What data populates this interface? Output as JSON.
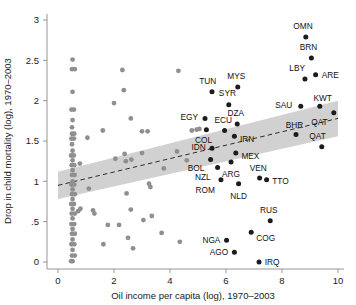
{
  "figure": {
    "name": "oil-income-child-mortality-scatter",
    "xlabel": "Oil income per capita (log), 1970–2003",
    "ylabel": "Drop in child mortality (log), 1970–2003"
  },
  "chart_data": {
    "type": "scatter",
    "title": "",
    "xlabel": "Oil income per capita (log), 1970–2003",
    "ylabel": "Drop in child mortality (log), 1970–2003",
    "xlim": [
      0,
      10
    ],
    "ylim": [
      0,
      3
    ],
    "xticks": [
      0,
      2,
      4,
      6,
      8,
      10
    ],
    "xtick_labels": [
      "0",
      "2",
      "4",
      "6",
      "8",
      "10"
    ],
    "yticks": [
      0,
      0.5,
      1,
      1.5,
      2,
      2.5,
      3
    ],
    "ytick_labels": [
      "0",
      ".5",
      "1",
      "1.5",
      "2",
      "2.5",
      "3"
    ],
    "grid": false,
    "legend_position": "none",
    "series": [
      {
        "name": "labeled-oil-countries",
        "marker": "filled-circle",
        "color": "#1c1c1c",
        "points": [
          {
            "label": "OMN",
            "x": 8.85,
            "y": 2.79,
            "label_dx": -0.1,
            "label_dy": 0.13,
            "label_anchor": "middle"
          },
          {
            "label": "BRN",
            "x": 9.05,
            "y": 2.53,
            "label_dx": -0.1,
            "label_dy": 0.13,
            "label_anchor": "middle"
          },
          {
            "label": "LBY",
            "x": 8.82,
            "y": 2.27,
            "label_dx": -0.28,
            "label_dy": 0.13,
            "label_anchor": "middle"
          },
          {
            "label": "ARE",
            "x": 9.2,
            "y": 2.32,
            "label_dx": 0.22,
            "label_dy": 0.0,
            "label_anchor": "start"
          },
          {
            "label": "MYS",
            "x": 6.42,
            "y": 2.17,
            "label_dx": -0.05,
            "label_dy": 0.14,
            "label_anchor": "middle"
          },
          {
            "label": "TUN",
            "x": 5.5,
            "y": 2.11,
            "label_dx": -0.15,
            "label_dy": 0.13,
            "label_anchor": "middle"
          },
          {
            "label": "SYR",
            "x": 6.1,
            "y": 1.95,
            "label_dx": -0.05,
            "label_dy": 0.14,
            "label_anchor": "middle"
          },
          {
            "label": "SAU",
            "x": 8.67,
            "y": 1.93,
            "label_dx": -0.3,
            "label_dy": 0.02,
            "label_anchor": "end"
          },
          {
            "label": "KWT",
            "x": 9.35,
            "y": 1.93,
            "label_dx": 0.1,
            "label_dy": 0.1,
            "label_anchor": "middle"
          },
          {
            "label": "EGY",
            "x": 5.25,
            "y": 1.78,
            "label_dx": -0.25,
            "label_dy": 0.02,
            "label_anchor": "end"
          },
          {
            "label": "DZA",
            "x": 6.4,
            "y": 1.71,
            "label_dx": -0.05,
            "label_dy": 0.14,
            "label_anchor": "middle"
          },
          {
            "label": "ECU",
            "x": 5.95,
            "y": 1.63,
            "label_dx": -0.05,
            "label_dy": 0.13,
            "label_anchor": "middle"
          },
          {
            "label": "QAT",
            "x": 9.85,
            "y": 1.85,
            "label_dx": -0.22,
            "label_dy": -0.12,
            "label_anchor": "end"
          },
          {
            "label": "COL",
            "x": 5.3,
            "y": 1.64,
            "label_dx": -0.1,
            "label_dy": -0.13,
            "label_anchor": "middle"
          },
          {
            "label": "IRN",
            "x": 6.3,
            "y": 1.56,
            "label_dx": 0.2,
            "label_dy": -0.03,
            "label_anchor": "start"
          },
          {
            "label": "BHR",
            "x": 8.5,
            "y": 1.58,
            "label_dx": -0.05,
            "label_dy": 0.12,
            "label_anchor": "middle"
          },
          {
            "label": "QAT",
            "x": 9.42,
            "y": 1.43,
            "label_dx": -0.15,
            "label_dy": 0.13,
            "label_anchor": "middle"
          },
          {
            "label": "IDN",
            "x": 5.5,
            "y": 1.41,
            "label_dx": -0.22,
            "label_dy": 0.02,
            "label_anchor": "end"
          },
          {
            "label": "MEX",
            "x": 6.35,
            "y": 1.35,
            "label_dx": 0.2,
            "label_dy": -0.03,
            "label_anchor": "start"
          },
          {
            "label": "BOL",
            "x": 5.45,
            "y": 1.27,
            "label_dx": -0.22,
            "label_dy": -0.1,
            "label_anchor": "end"
          },
          {
            "label": "ARG",
            "x": 6.18,
            "y": 1.24,
            "label_dx": 0.0,
            "label_dy": -0.15,
            "label_anchor": "middle"
          },
          {
            "label": "NZL",
            "x": 5.7,
            "y": 1.17,
            "label_dx": -0.25,
            "label_dy": -0.12,
            "label_anchor": "end"
          },
          {
            "label": "VEN",
            "x": 7.2,
            "y": 1.04,
            "label_dx": -0.05,
            "label_dy": 0.13,
            "label_anchor": "middle"
          },
          {
            "label": "TTO",
            "x": 7.45,
            "y": 1.02,
            "label_dx": 0.2,
            "label_dy": -0.02,
            "label_anchor": "start"
          },
          {
            "label": "ROM",
            "x": 5.82,
            "y": 1.02,
            "label_dx": -0.22,
            "label_dy": -0.13,
            "label_anchor": "end"
          },
          {
            "label": "NLD",
            "x": 6.45,
            "y": 0.97,
            "label_dx": 0.0,
            "label_dy": -0.15,
            "label_anchor": "middle"
          },
          {
            "label": "RUS",
            "x": 7.58,
            "y": 0.51,
            "label_dx": -0.05,
            "label_dy": 0.13,
            "label_anchor": "middle"
          },
          {
            "label": "COG",
            "x": 6.9,
            "y": 0.37,
            "label_dx": 0.18,
            "label_dy": -0.07,
            "label_anchor": "start"
          },
          {
            "label": "NGA",
            "x": 6.02,
            "y": 0.27,
            "label_dx": -0.22,
            "label_dy": 0.0,
            "label_anchor": "end"
          },
          {
            "label": "AGO",
            "x": 6.3,
            "y": 0.12,
            "label_dx": -0.22,
            "label_dy": 0.0,
            "label_anchor": "end"
          },
          {
            "label": "IRQ",
            "x": 7.18,
            "y": 0.0,
            "label_dx": 0.2,
            "label_dy": 0.0,
            "label_anchor": "start"
          }
        ]
      },
      {
        "name": "unlabeled-countries",
        "marker": "filled-circle",
        "color": "#8f8f8f",
        "points": [
          {
            "x": 0.52,
            "y": 2.51
          },
          {
            "x": 0.5,
            "y": 2.39
          },
          {
            "x": 0.6,
            "y": 2.39
          },
          {
            "x": 0.52,
            "y": 2.11
          },
          {
            "x": 0.48,
            "y": 1.89
          },
          {
            "x": 0.57,
            "y": 1.89
          },
          {
            "x": 0.52,
            "y": 1.76
          },
          {
            "x": 0.5,
            "y": 1.67
          },
          {
            "x": 0.5,
            "y": 1.59
          },
          {
            "x": 0.58,
            "y": 1.59
          },
          {
            "x": 0.48,
            "y": 1.53
          },
          {
            "x": 0.57,
            "y": 1.53
          },
          {
            "x": 0.5,
            "y": 1.46
          },
          {
            "x": 0.52,
            "y": 1.38
          },
          {
            "x": 0.47,
            "y": 1.32
          },
          {
            "x": 0.56,
            "y": 1.32
          },
          {
            "x": 0.52,
            "y": 1.26
          },
          {
            "x": 0.49,
            "y": 1.2
          },
          {
            "x": 0.58,
            "y": 1.2
          },
          {
            "x": 0.52,
            "y": 1.14
          },
          {
            "x": 0.5,
            "y": 1.08
          },
          {
            "x": 0.59,
            "y": 1.08
          },
          {
            "x": 0.52,
            "y": 1.0
          },
          {
            "x": 0.48,
            "y": 0.96
          },
          {
            "x": 0.58,
            "y": 0.96
          },
          {
            "x": 0.52,
            "y": 0.9
          },
          {
            "x": 0.5,
            "y": 0.84
          },
          {
            "x": 0.6,
            "y": 0.84
          },
          {
            "x": 0.52,
            "y": 0.78
          },
          {
            "x": 0.47,
            "y": 0.72
          },
          {
            "x": 0.57,
            "y": 0.72
          },
          {
            "x": 0.52,
            "y": 0.66
          },
          {
            "x": 0.49,
            "y": 0.6
          },
          {
            "x": 0.6,
            "y": 0.6
          },
          {
            "x": 0.52,
            "y": 0.54
          },
          {
            "x": 0.48,
            "y": 0.47
          },
          {
            "x": 0.58,
            "y": 0.47
          },
          {
            "x": 0.52,
            "y": 0.41
          },
          {
            "x": 0.5,
            "y": 0.35
          },
          {
            "x": 0.6,
            "y": 0.35
          },
          {
            "x": 0.52,
            "y": 0.28
          },
          {
            "x": 0.48,
            "y": 0.22
          },
          {
            "x": 0.58,
            "y": 0.22
          },
          {
            "x": 0.52,
            "y": 0.15
          },
          {
            "x": 0.5,
            "y": 0.08
          },
          {
            "x": 0.6,
            "y": 0.08
          },
          {
            "x": 0.52,
            "y": 0.01
          },
          {
            "x": 0.47,
            "y": 0.01
          },
          {
            "x": 0.78,
            "y": 1.22
          },
          {
            "x": 0.8,
            "y": 0.66
          },
          {
            "x": 0.72,
            "y": 0.63
          },
          {
            "x": 1.05,
            "y": 1.54
          },
          {
            "x": 1.1,
            "y": 0.91
          },
          {
            "x": 1.25,
            "y": 0.64
          },
          {
            "x": 1.3,
            "y": 0.6
          },
          {
            "x": 1.6,
            "y": 1.63
          },
          {
            "x": 1.62,
            "y": 0.22
          },
          {
            "x": 1.78,
            "y": 0.46
          },
          {
            "x": 2.0,
            "y": 1.97
          },
          {
            "x": 2.05,
            "y": 1.28
          },
          {
            "x": 2.18,
            "y": 0.46
          },
          {
            "x": 2.3,
            "y": 2.38
          },
          {
            "x": 2.35,
            "y": 2.13
          },
          {
            "x": 2.38,
            "y": 1.34
          },
          {
            "x": 2.42,
            "y": 1.25
          },
          {
            "x": 2.45,
            "y": 0.85
          },
          {
            "x": 2.5,
            "y": 0.3
          },
          {
            "x": 2.6,
            "y": 1.78
          },
          {
            "x": 2.62,
            "y": 1.27
          },
          {
            "x": 2.6,
            "y": 0.65
          },
          {
            "x": 2.68,
            "y": 0.17
          },
          {
            "x": 3.0,
            "y": 1.62
          },
          {
            "x": 3.0,
            "y": 1.35
          },
          {
            "x": 3.05,
            "y": 0.52
          },
          {
            "x": 3.2,
            "y": 1.62
          },
          {
            "x": 3.25,
            "y": 0.97
          },
          {
            "x": 3.3,
            "y": 0.93
          },
          {
            "x": 3.35,
            "y": 0.57
          },
          {
            "x": 3.7,
            "y": 0.36
          },
          {
            "x": 3.78,
            "y": 1.16
          },
          {
            "x": 4.25,
            "y": 1.37
          },
          {
            "x": 4.3,
            "y": 2.37
          },
          {
            "x": 4.35,
            "y": 0.25
          },
          {
            "x": 4.6,
            "y": 1.26
          },
          {
            "x": 4.78,
            "y": 1.63
          },
          {
            "x": 4.95,
            "y": 1.64
          },
          {
            "x": 5.05,
            "y": 1.65
          }
        ]
      }
    ],
    "fit_line": {
      "name": "linear-fit",
      "style": "dashed",
      "color": "#2b2b2b",
      "x_start": 0.0,
      "y_start": 0.95,
      "x_end": 10.0,
      "y_end": 1.78
    },
    "confidence_band": {
      "name": "confidence-interval-band",
      "color": "#c9c9c9",
      "upper": [
        {
          "x": 0.0,
          "y": 1.12
        },
        {
          "x": 10.0,
          "y": 2.0
        }
      ],
      "lower": [
        {
          "x": 0.0,
          "y": 0.78
        },
        {
          "x": 10.0,
          "y": 1.56
        }
      ]
    }
  }
}
